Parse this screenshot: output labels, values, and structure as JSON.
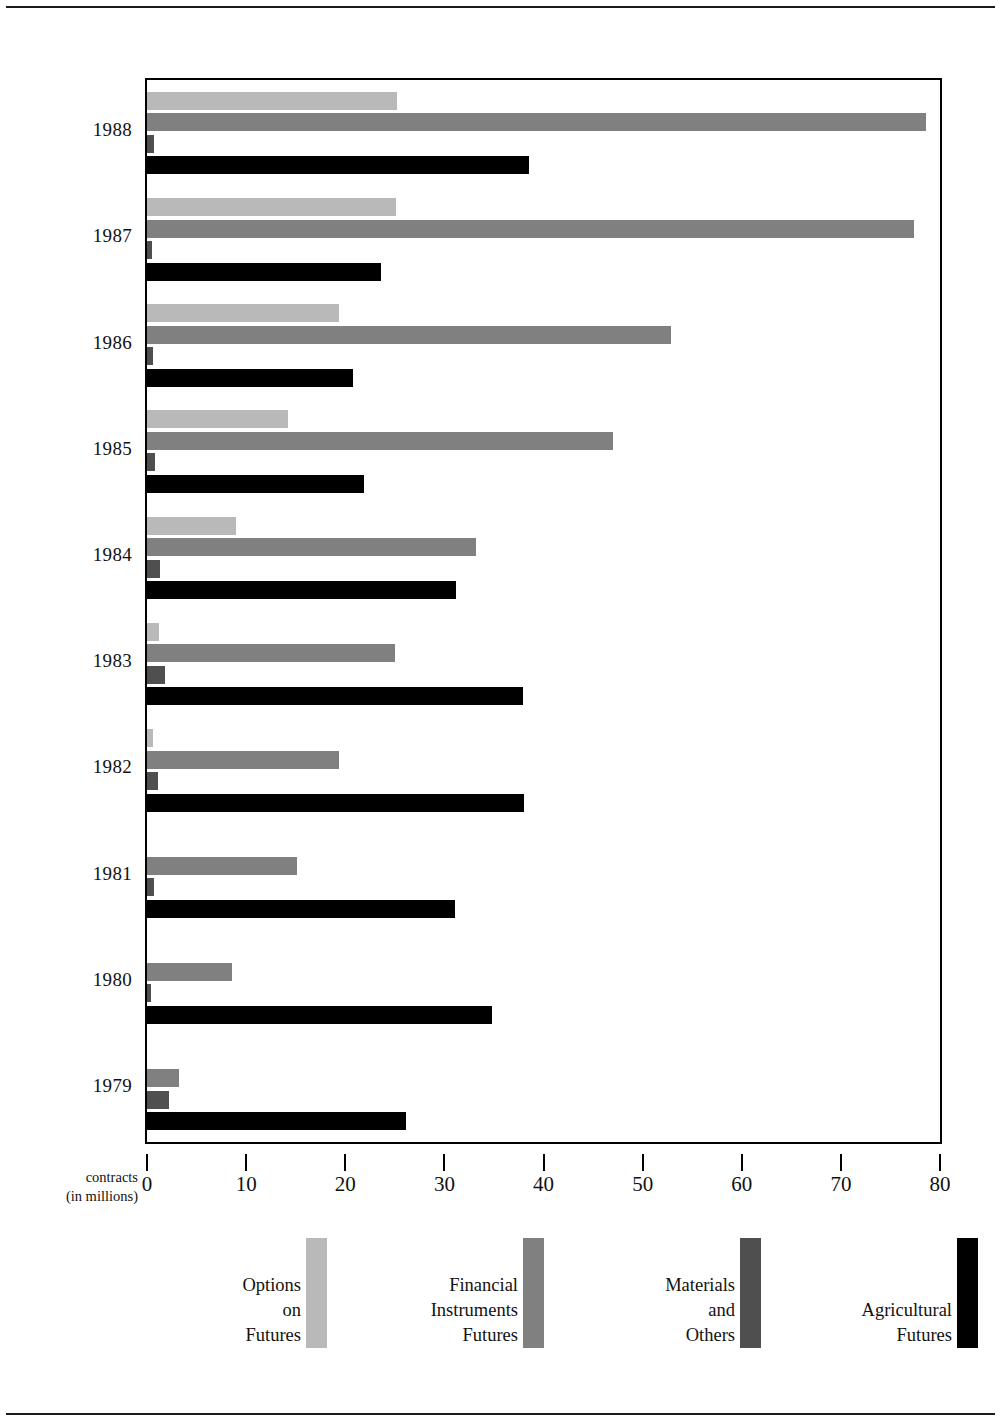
{
  "chart_data": {
    "type": "bar",
    "orientation": "horizontal",
    "title": "",
    "subtitle": "",
    "xlabel": "contracts\n(in millions)",
    "ylabel": "",
    "xlim": [
      0,
      80
    ],
    "xticks": [
      0,
      10,
      20,
      30,
      40,
      50,
      60,
      70,
      80
    ],
    "grid": false,
    "legend_position": "bottom",
    "categories": [
      "1988",
      "1987",
      "1986",
      "1985",
      "1984",
      "1983",
      "1982",
      "1981",
      "1980",
      "1979"
    ],
    "series": [
      {
        "name": "Options\non\nFutures",
        "color": "#b9b9b9",
        "values": [
          25.2,
          25.1,
          19.4,
          14.2,
          9.0,
          1.2,
          0.6,
          0.0,
          0.0,
          0.0
        ]
      },
      {
        "name": "Financial\nInstruments\nFutures",
        "color": "#808080",
        "values": [
          78.6,
          77.4,
          52.9,
          47.0,
          33.2,
          25.0,
          19.4,
          15.1,
          8.6,
          3.2
        ]
      },
      {
        "name": "Materials\nand\nOthers",
        "color": "#4f4f4f",
        "values": [
          0.7,
          0.5,
          0.6,
          0.8,
          1.3,
          1.8,
          1.1,
          0.7,
          0.4,
          2.2
        ]
      },
      {
        "name": "Agricultural\nFutures",
        "color": "#000000",
        "values": [
          38.5,
          23.6,
          20.8,
          21.9,
          31.2,
          37.9,
          38.0,
          31.1,
          34.8,
          26.1
        ]
      }
    ]
  },
  "axis": {
    "x_title_line1": "contracts",
    "x_title_line2": "(in millions)",
    "tick_labels": [
      "0",
      "10",
      "20",
      "30",
      "40",
      "50",
      "60",
      "70",
      "80"
    ]
  },
  "legend": {
    "items": [
      {
        "label": "Options\non\nFutures",
        "color": "#b9b9b9"
      },
      {
        "label": "Financial\nInstruments\nFutures",
        "color": "#808080"
      },
      {
        "label": "Materials\nand\nOthers",
        "color": "#4f4f4f"
      },
      {
        "label": "Agricultural\nFutures",
        "color": "#000000"
      }
    ]
  }
}
